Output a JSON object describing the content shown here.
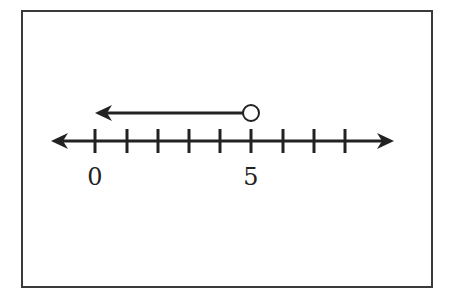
{
  "diagram": {
    "type": "number-line-inequality",
    "tick_count": 9,
    "tick_start_value": 0,
    "labels": [
      {
        "value": 0,
        "text": "0"
      },
      {
        "value": 5,
        "text": "5"
      }
    ],
    "inequality": {
      "endpoint": 5,
      "endpoint_style": "open-circle",
      "direction": "left",
      "expression": "x < 5"
    },
    "colors": {
      "stroke": "#222222",
      "frame": "#3a3a3a",
      "background": "#ffffff"
    }
  }
}
